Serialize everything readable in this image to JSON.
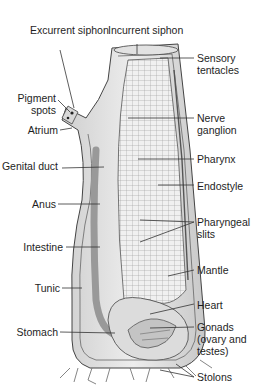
{
  "figure": {
    "labels": {
      "excurrent_siphon": "Excurrent siphon",
      "incurrent_siphon": "Incurrent siphon",
      "sensory_tentacles": "Sensory tentacles",
      "pigment_spots": "Pigment spots",
      "atrium": "Atrium",
      "nerve_ganglion": "Nerve ganglion",
      "pharynx": "Pharynx",
      "genital_duct": "Genital duct",
      "endostyle": "Endostyle",
      "anus": "Anus",
      "pharyngeal_slits": "Pharyngeal slits",
      "intestine": "Intestine",
      "mantle": "Mantle",
      "tunic": "Tunic",
      "heart": "Heart",
      "stomach": "Stomach",
      "gonads": "Gonads (ovary and testes)",
      "stolons": "Stolons"
    },
    "colors": {
      "line": "#333333",
      "shade": "#bdbdbd",
      "light": "#e6e6e6"
    }
  }
}
